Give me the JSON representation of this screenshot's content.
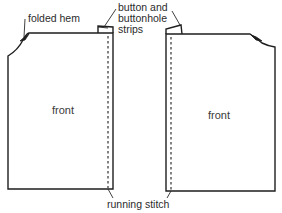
{
  "diagram": {
    "type": "sewing-pattern",
    "pieces": [
      {
        "id": "left-front",
        "label": "front"
      },
      {
        "id": "right-front",
        "label": "front"
      }
    ],
    "annotations": {
      "folded_hem": "folded hem",
      "strips_line1": "button and",
      "strips_line2": "buttonhole",
      "strips_line3": "strips",
      "running_stitch": "running stitch"
    },
    "colors": {
      "line": "#1e1e1e",
      "background": "#ffffff"
    }
  }
}
